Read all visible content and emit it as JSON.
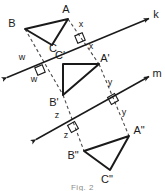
{
  "figure": {
    "caption": "Fig. 2",
    "stroke_color": "#1a1a1a",
    "dash_color": "#4a4a4a"
  },
  "lines": [
    {
      "name": "k",
      "label": "k",
      "type": "mirror-line",
      "x1": 4,
      "y1": 79,
      "x2": 152,
      "y2": 17
    },
    {
      "name": "m",
      "label": "m",
      "type": "mirror-line",
      "x1": 33,
      "y1": 141,
      "x2": 152,
      "y2": 75
    }
  ],
  "triangles": [
    {
      "name": "triangle-abc",
      "vertices": [
        {
          "label": "A",
          "x": 68,
          "y": 19
        },
        {
          "label": "B",
          "x": 25,
          "y": 29
        },
        {
          "label": "C",
          "x": 52,
          "y": 45
        }
      ],
      "labels": [
        {
          "text": "A",
          "x": 66,
          "y": 13
        },
        {
          "text": "B",
          "x": 12,
          "y": 27
        },
        {
          "text": "C",
          "x": 53,
          "y": 52
        }
      ]
    },
    {
      "name": "triangle-a-prime-b-prime-c-prime",
      "vertices": [
        {
          "label": "A'",
          "x": 99,
          "y": 64
        },
        {
          "label": "B'",
          "x": 63,
          "y": 95
        },
        {
          "label": "C'",
          "x": 63,
          "y": 64
        }
      ],
      "labels": [
        {
          "text": "A'",
          "x": 101,
          "y": 62
        },
        {
          "text": "B'",
          "x": 52,
          "y": 105
        },
        {
          "text": "C'",
          "x": 58,
          "y": 60
        }
      ]
    },
    {
      "name": "triangle-a-dprime-b-dprime-c-dprime",
      "vertices": [
        {
          "label": "A\"",
          "x": 129,
          "y": 136
        },
        {
          "label": "B\"",
          "x": 84,
          "y": 151
        },
        {
          "label": "C\"",
          "x": 110,
          "y": 170
        }
      ],
      "labels": [
        {
          "text": "A\"",
          "x": 133,
          "y": 134
        },
        {
          "text": "B\"",
          "x": 70,
          "y": 158
        },
        {
          "text": "C\"",
          "x": 104,
          "y": 182
        }
      ]
    }
  ],
  "connectors": [
    {
      "name": "connector-b-to-bprime",
      "from": "B",
      "to": "B'",
      "x1": 25,
      "y1": 29,
      "x2": 63,
      "y2": 95
    },
    {
      "name": "connector-a-to-aprime",
      "from": "A",
      "to": "A'",
      "x1": 68,
      "y1": 19,
      "x2": 99,
      "y2": 64
    },
    {
      "name": "connector-aprime-to-adprime",
      "from": "A'",
      "to": "A\"",
      "x1": 99,
      "y1": 64,
      "x2": 129,
      "y2": 136
    },
    {
      "name": "connector-bprime-to-bdprime",
      "from": "B'",
      "to": "B\"",
      "x1": 63,
      "y1": 95,
      "x2": 84,
      "y2": 151
    }
  ],
  "distance_labels": [
    {
      "name": "distance-w-upper",
      "text": "w",
      "x": 22,
      "y": 60
    },
    {
      "name": "distance-w-lower",
      "text": "w",
      "x": 32,
      "y": 81
    },
    {
      "name": "distance-x-upper",
      "text": "x",
      "x": 80,
      "y": 26
    },
    {
      "name": "distance-x-lower",
      "text": "x",
      "x": 89,
      "y": 48
    },
    {
      "name": "distance-y-upper",
      "text": "y",
      "x": 108,
      "y": 84
    },
    {
      "name": "distance-y-lower",
      "text": "y",
      "x": 122,
      "y": 114
    },
    {
      "name": "distance-z-upper",
      "text": "z",
      "x": 57,
      "y": 117
    },
    {
      "name": "distance-z-lower",
      "text": "z",
      "x": 65,
      "y": 137
    }
  ],
  "right_angle_marks": [
    {
      "name": "right-angle-b-k",
      "cx": 40,
      "cy": 70
    },
    {
      "name": "right-angle-a-k",
      "cx": 80,
      "cy": 38
    },
    {
      "name": "right-angle-a-m",
      "cx": 113,
      "cy": 99
    },
    {
      "name": "right-angle-b-m",
      "cx": 73,
      "cy": 127
    }
  ]
}
